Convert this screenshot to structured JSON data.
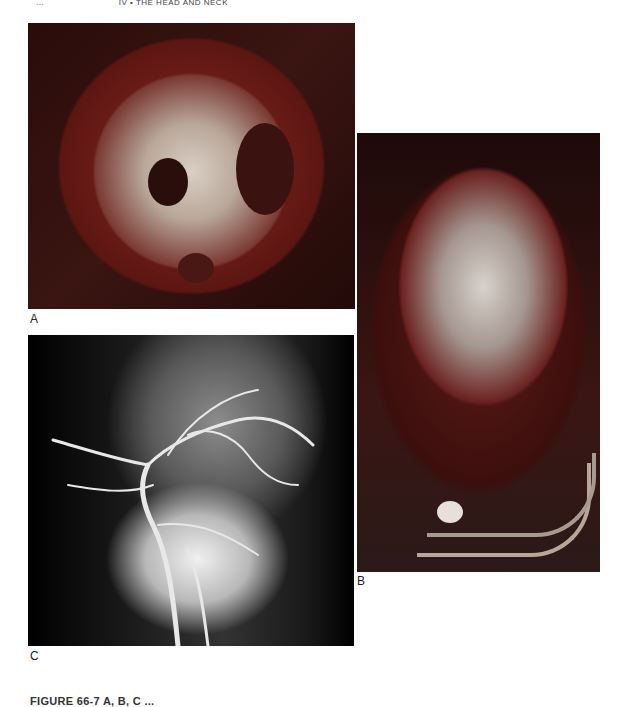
{
  "header": {
    "page_number": "...",
    "running_title": "IV  •  THE HEAD AND NECK"
  },
  "figure": {
    "panels": [
      {
        "label": "A",
        "description": "Autopsy photograph of skull base (cranial fossae) with fractures"
      },
      {
        "label": "B",
        "description": "Clinical photograph of bloodied face with nasal tubes"
      },
      {
        "label": "C",
        "description": "Angiogram showing head and neck arterial vasculature"
      }
    ],
    "caption": "FIGURE 66-7  A, B, C ..."
  }
}
